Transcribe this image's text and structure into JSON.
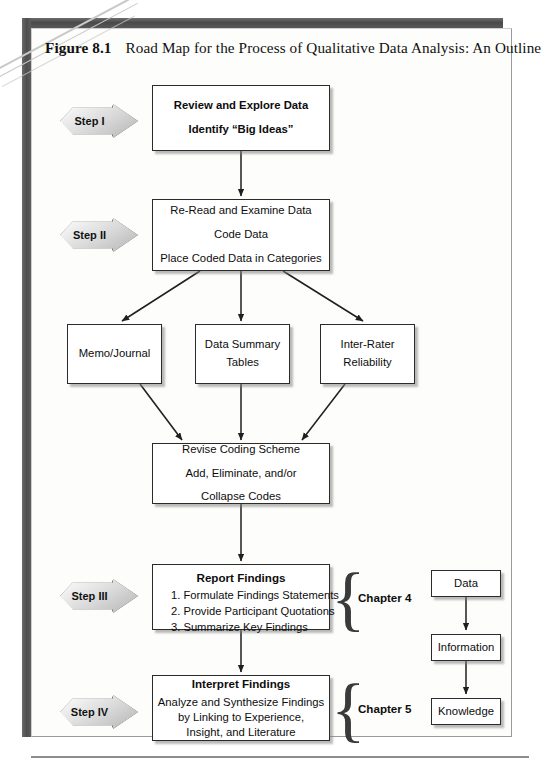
{
  "caption": {
    "figure_number": "Figure 8.1",
    "title": "Road Map for the Process of Qualitative Data Analysis: An Outline"
  },
  "steps": [
    {
      "id": "step-1",
      "label": "Step I"
    },
    {
      "id": "step-2",
      "label": "Step II"
    },
    {
      "id": "step-3",
      "label": "Step III"
    },
    {
      "id": "step-4",
      "label": "Step IV"
    }
  ],
  "boxes": {
    "review": {
      "line1": "Review and Explore Data",
      "line2": "Identify “Big Ideas”"
    },
    "reread": {
      "line1": "Re-Read and Examine Data",
      "line2": "Code Data",
      "line3": "Place Coded Data in Categories"
    },
    "memo": {
      "line1": "Memo/Journal"
    },
    "summary": {
      "line1": "Data Summary",
      "line2": "Tables"
    },
    "interrater": {
      "line1": "Inter-Rater",
      "line2": "Reliability"
    },
    "revise": {
      "line1": "Revise Coding Scheme",
      "line2": "Add, Eliminate, and/or",
      "line3": "Collapse Codes"
    },
    "report": {
      "header": "Report Findings",
      "item1": "1. Formulate Findings Statements",
      "item2": "2. Provide Participant Quotations",
      "item3": "3. Summarize Key Findings"
    },
    "interpret": {
      "header": "Interpret Findings",
      "line1": "Analyze and Synthesize Findings",
      "line2": "by Linking to Experience,",
      "line3": "Insight, and Literature"
    },
    "data": {
      "line1": "Data"
    },
    "information": {
      "line1": "Information"
    },
    "knowledge": {
      "line1": "Knowledge"
    }
  },
  "chapters": [
    {
      "id": "chapter-4",
      "label": "Chapter 4"
    },
    {
      "id": "chapter-5",
      "label": "Chapter 5"
    }
  ],
  "colors": {
    "box_border": "#2b2b2b",
    "page_border": "#4f4f4f",
    "arrow_fill_light": "#ffffff",
    "arrow_fill_dark": "#b4b4b4",
    "connector": "#1f1f1f"
  }
}
